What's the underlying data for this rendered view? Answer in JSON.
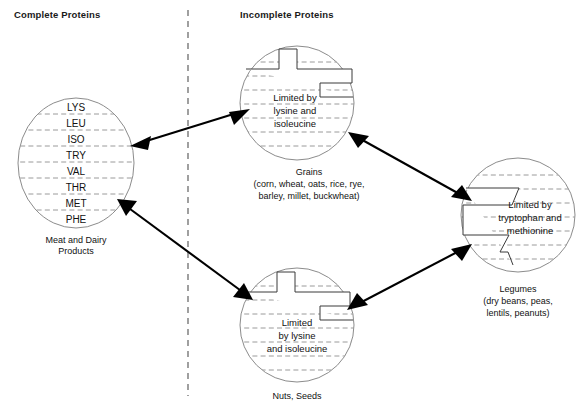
{
  "diagram": {
    "columns": {
      "left_header": "Complete Proteins",
      "right_header": "Incomplete Proteins"
    },
    "divider": {
      "icon": "vertical-dashed-divider",
      "x": 188,
      "y_start": 10,
      "y_end": 396
    }
  },
  "nodes": {
    "meat_dairy": {
      "id": "meat-and-dairy",
      "category": "complete",
      "caption_line1": "Meat and Dairy",
      "caption_line2": "Products",
      "amino_acids": [
        "LYS",
        "LEU",
        "ISO",
        "TRY",
        "VAL",
        "THR",
        "MET",
        "PHE"
      ],
      "notch": "none",
      "center": {
        "x": 76,
        "y": 163
      },
      "radius": 58
    },
    "grains": {
      "id": "grains",
      "category": "incomplete",
      "caption_line1": "Grains",
      "caption_line2": "(corn, wheat, oats, rice, rye,",
      "caption_line3": "barley, millet, buckwheat)",
      "inner_text_line1": "Limited by",
      "inner_text_line2": "lysine and",
      "inner_text_line3": "isoleucine",
      "limiting_amino_acids": [
        "lysine",
        "isoleucine"
      ],
      "notch": "top-right-step",
      "center": {
        "x": 297,
        "y": 103
      },
      "radius": 57
    },
    "legumes": {
      "id": "legumes",
      "category": "incomplete",
      "caption_line1": "Legumes",
      "caption_line2": "(dry beans, peas,",
      "caption_line3": "lentils, peanuts)",
      "inner_text_line1": "Limited by",
      "inner_text_line2": "tryptophan and",
      "inner_text_line3": "methionine",
      "limiting_amino_acids": [
        "tryptophan",
        "methionine"
      ],
      "notch": "left-step",
      "center": {
        "x": 518,
        "y": 215
      },
      "radius": 57
    },
    "nuts_seeds": {
      "id": "nuts-and-seeds",
      "category": "incomplete",
      "caption_line1": "Nuts, Seeds",
      "inner_text_line1": "Limited",
      "inner_text_line2": "by lysine",
      "inner_text_line3": "and isoleucine",
      "limiting_amino_acids": [
        "lysine",
        "isoleucine"
      ],
      "notch": "top-right-step",
      "center": {
        "x": 297,
        "y": 325
      },
      "radius": 57
    }
  },
  "connectors": [
    {
      "id": "meat-dairy-to-grains",
      "from": "meat_dairy",
      "to": "grains",
      "style": "double-headed-arrow"
    },
    {
      "id": "grains-to-legumes",
      "from": "grains",
      "to": "legumes",
      "style": "double-headed-arrow"
    },
    {
      "id": "legumes-to-nuts-seeds",
      "from": "legumes",
      "to": "nuts_seeds",
      "style": "double-headed-arrow"
    },
    {
      "id": "nuts-seeds-to-meat-dairy",
      "from": "nuts_seeds",
      "to": "meat_dairy",
      "style": "double-headed-arrow"
    }
  ],
  "colors": {
    "background": "#ffffff",
    "text": "#111111",
    "circle_stroke": "#8c8c8c",
    "notch_stroke": "#3a3a3a",
    "stripe_stroke": "#9a9a9a",
    "divider_stroke": "#6d6d6d",
    "arrow": "#000000"
  }
}
